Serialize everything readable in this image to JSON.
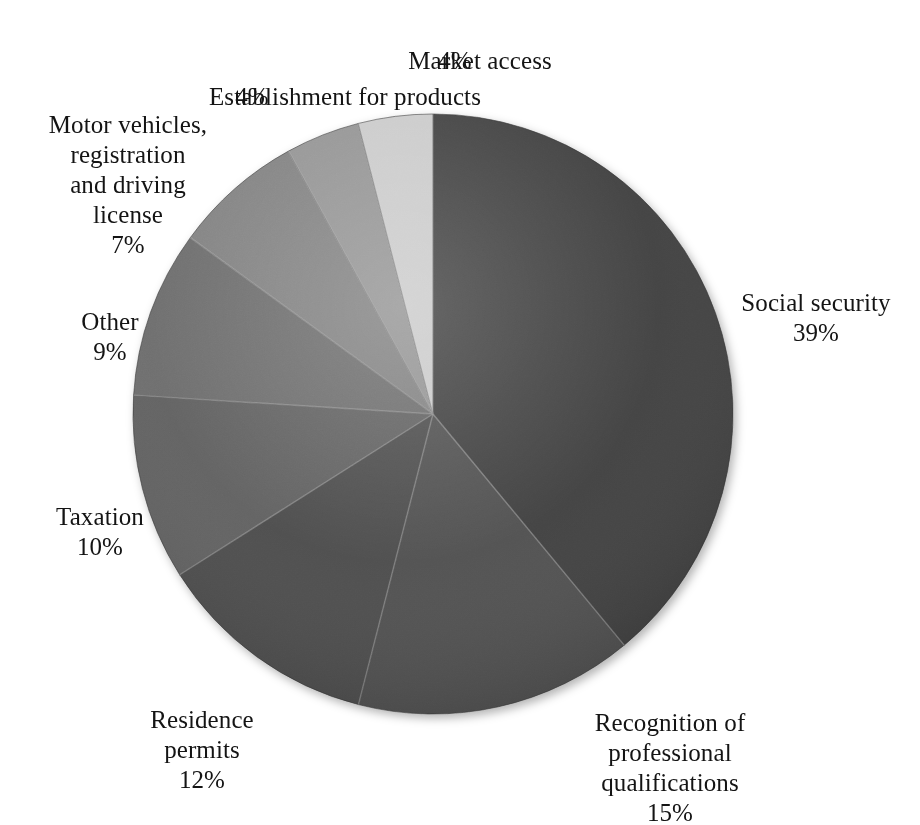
{
  "title_remnant": "",
  "chart_data": {
    "type": "pie",
    "title": "",
    "subtitle": "",
    "xlabel": "",
    "ylabel": "",
    "legend_position": "labels-outside",
    "grid": false,
    "value_suffix": "%",
    "total": 100,
    "start_angle_deg": 0,
    "direction": "clockwise",
    "categories": [
      "Social security",
      "Recognition of professional qualifications",
      "Residence permits",
      "Taxation",
      "Other",
      "Motor vehicles, registration and driving license",
      "Establishment for products",
      "Market access"
    ],
    "values": [
      39,
      15,
      12,
      10,
      9,
      7,
      4,
      4
    ],
    "colors": [
      "#3a3a3a",
      "#4c4c4c",
      "#474747",
      "#5b5b5b",
      "#686868",
      "#7d7d7d",
      "#909090",
      "#c9c9c9"
    ],
    "slices": [
      {
        "name": "Social security",
        "label": "Social security",
        "value": 39,
        "value_text": "39%",
        "color": "#3a3a3a"
      },
      {
        "name": "Recognition",
        "label": "Recognition of\nprofessional\nqualifications",
        "value": 15,
        "value_text": "15%",
        "color": "#4c4c4c"
      },
      {
        "name": "Residence permits",
        "label": "Residence\npermits",
        "value": 12,
        "value_text": "12%",
        "color": "#474747"
      },
      {
        "name": "Taxation",
        "label": "Taxation",
        "value": 10,
        "value_text": "10%",
        "color": "#5b5b5b"
      },
      {
        "name": "Other",
        "label": "Other",
        "value": 9,
        "value_text": "9%",
        "color": "#686868"
      },
      {
        "name": "Motor vehicles",
        "label": "Motor vehicles,\nregistration\nand driving\nlicense",
        "value": 7,
        "value_text": "7%",
        "color": "#7d7d7d"
      },
      {
        "name": "Establishment",
        "label": "Establishment for products",
        "value": 4,
        "value_text": "4%",
        "color": "#909090"
      },
      {
        "name": "Market access",
        "label": "Market access",
        "value": 4,
        "value_text": "4%",
        "color": "#c9c9c9"
      }
    ]
  },
  "labels": {
    "market_access": {
      "text": "Market access",
      "pct": "4%"
    },
    "establishment": {
      "text": "Establishment for products",
      "pct": "4%"
    },
    "motor": {
      "text": "Motor vehicles,\nregistration\nand driving\nlicense",
      "pct": "7%"
    },
    "other": {
      "text": "Other",
      "pct": "9%"
    },
    "taxation": {
      "text": "Taxation",
      "pct": "10%"
    },
    "social": {
      "text": "Social security",
      "pct": "39%"
    },
    "residence": {
      "text": "Residence\npermits",
      "pct": "12%"
    },
    "recognition": {
      "text": "Recognition of\nprofessional\nqualifications",
      "pct": "15%"
    }
  },
  "geometry": {
    "cx": 433,
    "cy": 414,
    "r": 300
  }
}
